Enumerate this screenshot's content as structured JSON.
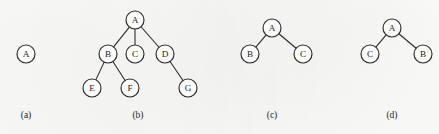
{
  "figure": {
    "type": "diagram",
    "width": 439,
    "height": 134,
    "background_color": "#fcfcfb",
    "node_stroke_color": "#2b2b2b",
    "node_fill_color": "#fdfdfc",
    "edge_color": "#2b2b2b",
    "text_color": "#1d1d1d",
    "node_radius": 9
  },
  "panels": [
    {
      "id": "a",
      "caption": "(a)",
      "caption_x": 26,
      "caption_y": 110,
      "nodes": [
        {
          "id": "A",
          "label": "A",
          "x": 26,
          "y": 54
        }
      ],
      "edges": []
    },
    {
      "id": "b",
      "caption": "(b)",
      "caption_x": 138,
      "caption_y": 110,
      "nodes": [
        {
          "id": "A",
          "label": "A",
          "x": 135,
          "y": 20
        },
        {
          "id": "B",
          "label": "B",
          "x": 108,
          "y": 54
        },
        {
          "id": "C",
          "label": "C",
          "x": 135,
          "y": 54
        },
        {
          "id": "D",
          "label": "D",
          "x": 165,
          "y": 54
        },
        {
          "id": "E",
          "label": "E",
          "x": 92,
          "y": 88
        },
        {
          "id": "F",
          "label": "F",
          "x": 130,
          "y": 88
        },
        {
          "id": "G",
          "label": "G",
          "x": 188,
          "y": 88
        }
      ],
      "edges": [
        {
          "from": "A",
          "to": "B"
        },
        {
          "from": "A",
          "to": "C"
        },
        {
          "from": "A",
          "to": "D"
        },
        {
          "from": "B",
          "to": "E"
        },
        {
          "from": "B",
          "to": "F"
        },
        {
          "from": "D",
          "to": "G"
        }
      ]
    },
    {
      "id": "c",
      "caption": "(c)",
      "caption_x": 272,
      "caption_y": 110,
      "nodes": [
        {
          "id": "A",
          "label": "A",
          "x": 272,
          "y": 28
        },
        {
          "id": "B",
          "label": "B",
          "x": 250,
          "y": 54
        },
        {
          "id": "C",
          "label": "C",
          "x": 303,
          "y": 54
        }
      ],
      "edges": [
        {
          "from": "A",
          "to": "B"
        },
        {
          "from": "A",
          "to": "C"
        }
      ]
    },
    {
      "id": "d",
      "caption": "(d)",
      "caption_x": 392,
      "caption_y": 110,
      "nodes": [
        {
          "id": "A",
          "label": "A",
          "x": 392,
          "y": 28
        },
        {
          "id": "C",
          "label": "C",
          "x": 370,
          "y": 54
        },
        {
          "id": "B",
          "label": "B",
          "x": 423,
          "y": 54
        }
      ],
      "edges": [
        {
          "from": "A",
          "to": "C"
        },
        {
          "from": "A",
          "to": "B"
        }
      ]
    }
  ]
}
